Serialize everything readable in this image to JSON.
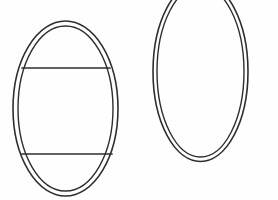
{
  "canvas": {
    "width": 278,
    "height": 200,
    "background_color": "#fefefe",
    "title": "Line drawing of two concentric ellipses"
  },
  "style": {
    "ink_color": "#2e2e2e",
    "outer_stroke_width": 1.6,
    "inner_stroke_width": 1.4,
    "chord_stroke_width": 1.7
  },
  "shapes": [
    {
      "name": "left-banded-ellipse",
      "kind": "double-ellipse-with-chords",
      "outer": {
        "cx": 65.5,
        "cy": 108.5,
        "rx": 52.5,
        "ry": 87.5
      },
      "inner": {
        "cx": 65.5,
        "cy": 108.5,
        "rx": 47.5,
        "ry": 82.5
      },
      "chords": [
        {
          "name": "upper-chord",
          "x1": 22,
          "y1": 68,
          "x2": 110,
          "y2": 68
        },
        {
          "name": "lower-chord",
          "x1": 22,
          "y1": 154,
          "x2": 112,
          "y2": 154
        }
      ]
    },
    {
      "name": "right-plain-ellipse",
      "kind": "double-ellipse",
      "clipped_edge": "top",
      "outer": {
        "cx": 200.5,
        "cy": 71.5,
        "rx": 47.5,
        "ry": 90.0
      },
      "inner": {
        "cx": 200.5,
        "cy": 71.5,
        "rx": 43.5,
        "ry": 85.5
      },
      "chords": []
    }
  ]
}
